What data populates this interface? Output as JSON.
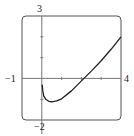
{
  "chart_data": {
    "type": "line",
    "title": "",
    "xlabel": "",
    "ylabel": "",
    "xlim": [
      -1,
      4
    ],
    "ylim": [
      -2,
      3
    ],
    "grid": false,
    "legend": null,
    "tick_labels": {
      "x_min": "−1",
      "x_max": "4",
      "y_max": "3",
      "y_min": "−2"
    },
    "x_ticks": [
      1,
      2,
      3
    ],
    "y_ticks": [
      -1,
      1,
      2
    ],
    "series": [
      {
        "name": "f(x)",
        "x": [
          0.02,
          0.05,
          0.1,
          0.2,
          0.35,
          0.5,
          0.75,
          1.0,
          1.5,
          2.0,
          2.13,
          2.5,
          3.0,
          3.5,
          4.0
        ],
        "y": [
          -0.3,
          -0.6,
          -0.85,
          -1.0,
          -1.1,
          -1.13,
          -1.08,
          -0.98,
          -0.6,
          -0.12,
          0.0,
          0.35,
          0.85,
          1.4,
          2.0
        ]
      }
    ]
  },
  "colors": {
    "frame": "#555555",
    "axes": "#666666",
    "curve": "#222222"
  }
}
